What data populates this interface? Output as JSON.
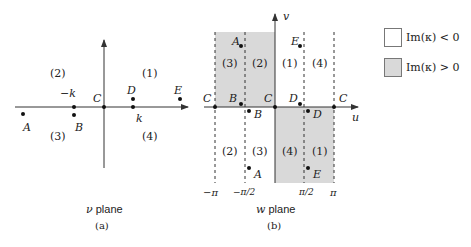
{
  "panel_a": {
    "caption_var": "ν",
    "caption_text": " plane",
    "sublabel": "(a)",
    "points": {
      "A": "A",
      "B": "B",
      "C": "C",
      "D": "D",
      "E": "E"
    },
    "tick_neg_k": "−k",
    "tick_k": "k",
    "regions": [
      "(1)",
      "(2)",
      "(3)",
      "(4)"
    ]
  },
  "panel_b": {
    "caption_var": "w",
    "caption_text": " plane",
    "sublabel": "(b)",
    "axis_u": "u",
    "axis_v": "v",
    "points": {
      "A": "A",
      "B": "B",
      "C": "C",
      "D": "D",
      "E": "E"
    },
    "ticks": [
      "−π",
      "−π/2",
      "π/2",
      "π"
    ],
    "regions_top": [
      "(3)",
      "(2)",
      "(1)",
      "(4)"
    ],
    "regions_bottom": [
      "(2)",
      "(3)",
      "(4)",
      "(1)"
    ]
  },
  "legend": {
    "items": [
      {
        "label": "Im(κ) < 0",
        "color": "#ffffff"
      },
      {
        "label": "Im(κ) > 0",
        "color": "#d9d9d9"
      }
    ]
  },
  "colors": {
    "shade": "#d9d9d9",
    "ink": "#222222"
  }
}
